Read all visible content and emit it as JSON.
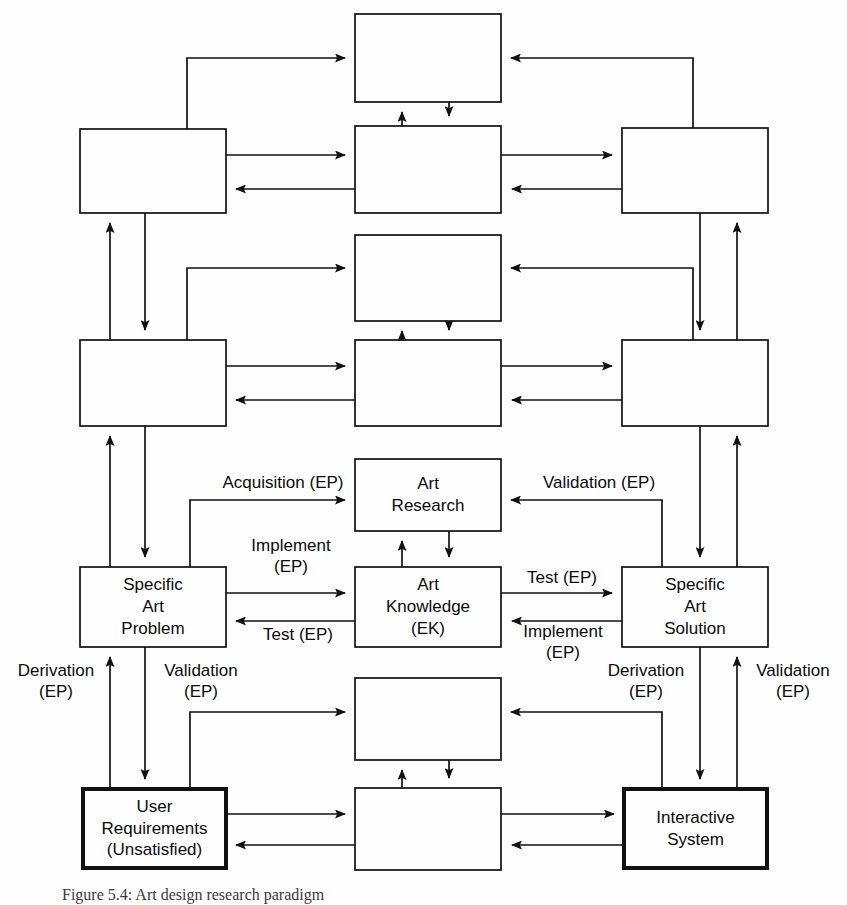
{
  "figure": {
    "caption": "Figure 5.4:  Art design research paradigm",
    "colors": {
      "stroke": "#111111",
      "background": "#fefefe",
      "text": "#0b0b0b",
      "emphasis_stroke": "#000000"
    }
  },
  "boxes": [
    {
      "id": "top-middle",
      "lines": []
    },
    {
      "id": "row2-left",
      "lines": []
    },
    {
      "id": "row2-middle",
      "lines": []
    },
    {
      "id": "row2-right",
      "lines": []
    },
    {
      "id": "row3-middle",
      "lines": []
    },
    {
      "id": "row4-left",
      "lines": []
    },
    {
      "id": "row4-middle",
      "lines": []
    },
    {
      "id": "row4-right",
      "lines": []
    },
    {
      "id": "art-research",
      "lines": [
        "Art",
        "Research"
      ]
    },
    {
      "id": "specific-art-problem",
      "lines": [
        "Specific",
        "Art",
        "Problem"
      ]
    },
    {
      "id": "art-knowledge",
      "lines": [
        "Art",
        "Knowledge",
        "(EK)"
      ]
    },
    {
      "id": "specific-art-solution",
      "lines": [
        "Specific",
        "Art",
        "Solution"
      ]
    },
    {
      "id": "row7-middle",
      "lines": []
    },
    {
      "id": "user-requirements",
      "lines": [
        "User",
        "Requirements",
        "(Unsatisfied)"
      ]
    },
    {
      "id": "row8-middle",
      "lines": []
    },
    {
      "id": "interactive-system",
      "lines": [
        "Interactive",
        "System"
      ]
    }
  ],
  "edge_labels": [
    {
      "id": "acquisition-ep",
      "text": "Acquisition (EP)"
    },
    {
      "id": "validation-ep-research",
      "text": "Validation (EP)"
    },
    {
      "id": "implement-ep-problem",
      "text": "Implement\n(EP)"
    },
    {
      "id": "test-ep-problem",
      "text": "Test (EP)"
    },
    {
      "id": "test-ep-solution",
      "text": "Test (EP)"
    },
    {
      "id": "implement-ep-solution",
      "text": "Implement\n(EP)"
    },
    {
      "id": "derivation-ep-left",
      "text": "Derivation\n(EP)"
    },
    {
      "id": "validation-ep-left",
      "text": "Validation\n(EP)"
    },
    {
      "id": "derivation-ep-right",
      "text": "Derivation\n(EP)"
    },
    {
      "id": "validation-ep-right",
      "text": "Validation\n(EP)"
    }
  ]
}
